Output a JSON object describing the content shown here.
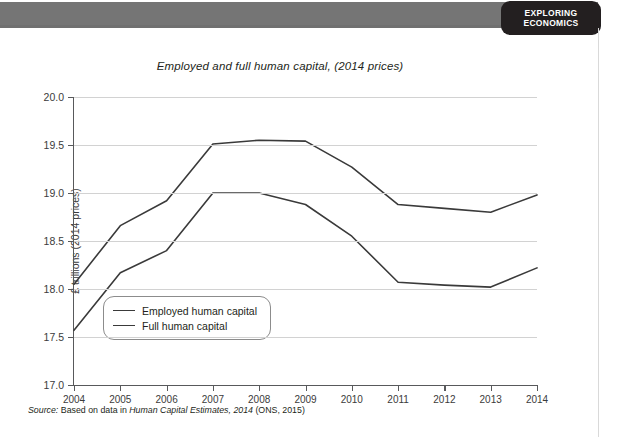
{
  "header": {
    "badge_line1": "EXPLORING",
    "badge_line2": "ECONOMICS",
    "band_color": "#757575",
    "badge_color": "#231f20"
  },
  "source_note": {
    "label": "Source:",
    "lead": "Based on data in",
    "italic_title": "Human Capital Estimates, 2014",
    "tail": "(ONS, 2015)"
  },
  "chart_data": {
    "type": "line",
    "title": "Employed and full human capital,  (2014 prices)",
    "xlabel": "",
    "ylabel": "£ trillions (2014 prices)",
    "x": [
      2004,
      2005,
      2006,
      2007,
      2008,
      2009,
      2010,
      2011,
      2012,
      2013,
      2014
    ],
    "xtick_labels": [
      "2004",
      "2005",
      "2006",
      "2007",
      "2008",
      "2009",
      "2010",
      "2011",
      "2012",
      "2013",
      "2014"
    ],
    "ytick_labels": [
      "17.0",
      "17.5",
      "18.0",
      "18.5",
      "19.0",
      "19.5",
      "20.0"
    ],
    "yticks": [
      17.0,
      17.5,
      18.0,
      18.5,
      19.0,
      19.5,
      20.0
    ],
    "ylim": [
      17.0,
      20.0
    ],
    "xlim": [
      2004,
      2014
    ],
    "grid": "horizontal",
    "legend_position": "lower-left-inside",
    "line_color": "#3a3a3a",
    "grid_color": "#d2d2d2",
    "series": [
      {
        "name": "Employed human capital",
        "values": [
          17.57,
          18.17,
          18.4,
          19.0,
          19.0,
          18.88,
          18.55,
          18.07,
          18.04,
          18.02,
          18.22
        ]
      },
      {
        "name": "Full human capital",
        "values": [
          18.05,
          18.66,
          18.92,
          19.51,
          19.55,
          19.54,
          19.27,
          18.88,
          18.84,
          18.8,
          18.98
        ]
      }
    ]
  }
}
